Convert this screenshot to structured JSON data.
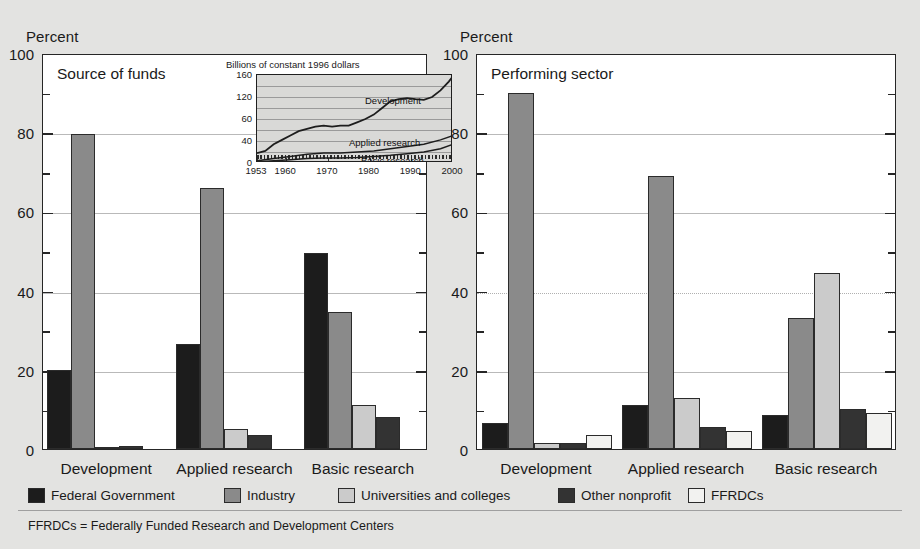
{
  "figure": {
    "background_color": "#e3e3e1",
    "percent_label": "Percent",
    "footnote": "FFRDCs = Federally Funded Research and Development Centers"
  },
  "legend": {
    "items": [
      {
        "label": "Federal Government",
        "color": "#1c1c1c",
        "key": "federal"
      },
      {
        "label": "Industry",
        "color": "#8a8a8a",
        "key": "industry"
      },
      {
        "label": "Universities and colleges",
        "color": "#cbcbcb",
        "key": "univ"
      },
      {
        "label": "Other nonprofit",
        "color": "#333333",
        "key": "nonprofit"
      },
      {
        "label": "FFRDCs",
        "color": "#f2f2f0",
        "key": "ffrdc"
      }
    ]
  },
  "chart_data": [
    {
      "type": "bar",
      "id": "source-of-funds",
      "title": "Source of funds",
      "xlabel": "",
      "ylabel": "Percent",
      "ylim": [
        0,
        100
      ],
      "yticks": [
        0,
        20,
        40,
        60,
        80,
        100
      ],
      "yminorticks": [
        10,
        30,
        50,
        70,
        90
      ],
      "grid": true,
      "categories": [
        "Development",
        "Applied research",
        "Basic research"
      ],
      "series": [
        {
          "name": "Federal Government",
          "values": [
            20.0,
            26.5,
            49.5
          ]
        },
        {
          "name": "Industry",
          "values": [
            79.5,
            66.0,
            34.5
          ]
        },
        {
          "name": "Universities and colleges",
          "values": [
            0.2,
            5.0,
            11.0
          ]
        },
        {
          "name": "Other nonprofit",
          "values": [
            0.8,
            3.5,
            8.0
          ]
        },
        {
          "name": "FFRDCs",
          "values": [
            0.0,
            0.0,
            0.0
          ]
        }
      ]
    },
    {
      "type": "bar",
      "id": "performing-sector",
      "title": "Performing sector",
      "xlabel": "",
      "ylabel": "Percent",
      "ylim": [
        0,
        100
      ],
      "yticks": [
        0,
        20,
        40,
        60,
        80,
        100
      ],
      "yminorticks": [
        10,
        30,
        50,
        70,
        90
      ],
      "grid": true,
      "categories": [
        "Development",
        "Applied research",
        "Basic research"
      ],
      "series": [
        {
          "name": "Federal Government",
          "values": [
            6.5,
            11.0,
            8.5
          ]
        },
        {
          "name": "Industry",
          "values": [
            90.0,
            69.0,
            33.0
          ]
        },
        {
          "name": "Universities and colleges",
          "values": [
            1.5,
            13.0,
            44.5
          ]
        },
        {
          "name": "Other nonprofit",
          "values": [
            1.5,
            5.5,
            10.0
          ]
        },
        {
          "name": "FFRDCs",
          "values": [
            3.5,
            4.5,
            9.0
          ]
        }
      ]
    },
    {
      "type": "line",
      "id": "inset-trend",
      "title": "Billions of constant 1996 dollars",
      "xlabel": "",
      "ylabel": "Billions of constant 1996 dollars",
      "ylim": [
        0,
        160
      ],
      "yticks": [
        0,
        40,
        60,
        120,
        160
      ],
      "ytick_labels": [
        "0",
        "40",
        "60",
        "120",
        "160"
      ],
      "xlim": [
        1953,
        2000
      ],
      "xticks": [
        1953,
        1960,
        1970,
        1980,
        1990,
        2000
      ],
      "xtick_labels": [
        "1953",
        "1960",
        "1970",
        "1980",
        "1990",
        "2000"
      ],
      "grid": true,
      "annotations": [
        "Development",
        "Applied research",
        "Basic research"
      ],
      "series": [
        {
          "name": "Development",
          "x": [
            1953,
            1955,
            1957,
            1959,
            1961,
            1963,
            1965,
            1967,
            1969,
            1971,
            1973,
            1975,
            1977,
            1979,
            1981,
            1983,
            1985,
            1987,
            1989,
            1991,
            1993,
            1995,
            1997,
            1999,
            2000
          ],
          "values": [
            18,
            22,
            34,
            42,
            50,
            58,
            62,
            66,
            68,
            66,
            68,
            68,
            74,
            80,
            88,
            100,
            112,
            116,
            118,
            116,
            115,
            120,
            132,
            148,
            158
          ]
        },
        {
          "name": "Applied research",
          "x": [
            1953,
            1957,
            1961,
            1965,
            1969,
            1973,
            1977,
            1981,
            1985,
            1989,
            1993,
            1997,
            2000
          ],
          "values": [
            4,
            8,
            12,
            16,
            18,
            18,
            20,
            22,
            26,
            30,
            34,
            42,
            50
          ]
        },
        {
          "name": "Basic research",
          "x": [
            1953,
            1957,
            1961,
            1965,
            1969,
            1973,
            1977,
            1981,
            1985,
            1989,
            1993,
            1997,
            2000
          ],
          "values": [
            2,
            4,
            6,
            8,
            9,
            9,
            10,
            12,
            14,
            17,
            20,
            26,
            34
          ]
        }
      ]
    }
  ]
}
